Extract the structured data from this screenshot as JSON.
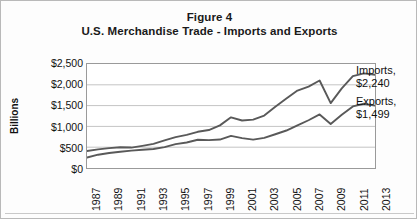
{
  "figure": {
    "title_line1": "Figure 4",
    "title_line2": "U.S. Merchandise Trade - Imports and Exports"
  },
  "annotations": {
    "imports_label": "Imports,",
    "imports_value": "$2,240",
    "exports_label": "Exports,",
    "exports_value": "$1,499"
  },
  "chart_data": {
    "type": "line",
    "xlabel": "",
    "ylabel": "Billions",
    "ylim": [
      0,
      2500
    ],
    "ytick_labels": [
      "$2,500",
      "$2,000",
      "$1,500",
      "$1,000",
      "$500",
      "$0"
    ],
    "ytick_values": [
      2500,
      2000,
      1500,
      1000,
      500,
      0
    ],
    "grid": true,
    "legend": "none (series labeled at line ends)",
    "xlim": [
      1987,
      2013
    ],
    "tick_labels": [
      "1987",
      "1989",
      "1991",
      "1993",
      "1995",
      "1997",
      "1999",
      "2001",
      "2003",
      "2005",
      "2007",
      "2009",
      "2011",
      "2013"
    ],
    "x": [
      1987,
      1988,
      1989,
      1990,
      1991,
      1992,
      1993,
      1994,
      1995,
      1996,
      1997,
      1998,
      1999,
      2000,
      2001,
      2002,
      2003,
      2004,
      2005,
      2006,
      2007,
      2008,
      2009,
      2010,
      2011,
      2012,
      2013
    ],
    "series": [
      {
        "name": "Imports",
        "end_label": "Imports, $2,240",
        "values": [
          410,
          447,
          477,
          498,
          491,
          533,
          580,
          663,
          743,
          795,
          870,
          912,
          1025,
          1218,
          1141,
          1163,
          1260,
          1473,
          1671,
          1861,
          1957,
          2104,
          1560,
          1913,
          2208,
          2276,
          2240
        ]
      },
      {
        "name": "Exports",
        "end_label": "Exports, $1,499",
        "values": [
          250,
          320,
          362,
          389,
          417,
          440,
          457,
          502,
          575,
          612,
          679,
          670,
          684,
          772,
          719,
          682,
          725,
          811,
          901,
          1026,
          1148,
          1287,
          1056,
          1278,
          1480,
          1545,
          1499
        ]
      }
    ]
  },
  "colors": {
    "line": "#595959",
    "grid": "#c4c4c4",
    "frame": "#9a9a9a",
    "text": "#111111",
    "page_border": "#b9b9b9"
  }
}
